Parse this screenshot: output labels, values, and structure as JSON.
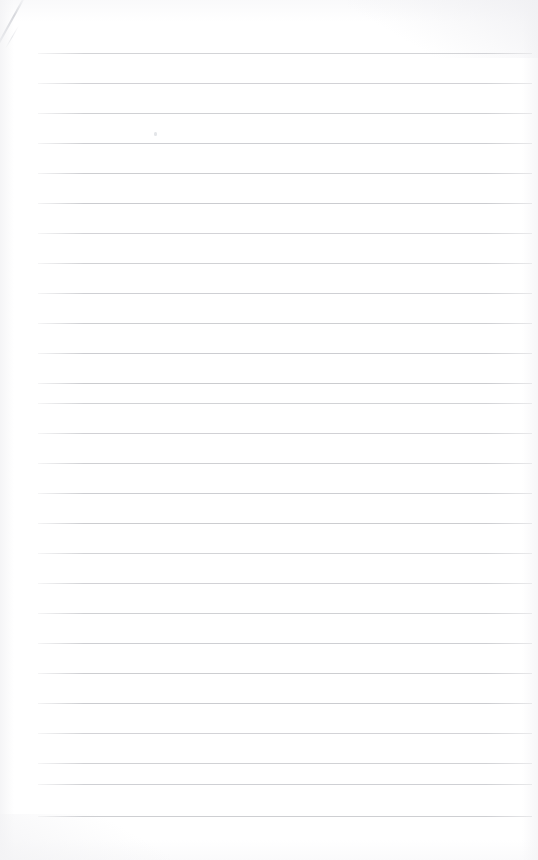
{
  "document": {
    "kind": "scanned-page",
    "title": "Blank Lined Notepad Page",
    "content_text": "",
    "page_width": 538,
    "page_height": 860,
    "background_color": "#ffffff"
  },
  "ruling": {
    "line_color": "#c9cace",
    "line_thickness_px": 1,
    "line_spacing_px": 30,
    "first_line_y": 53,
    "left_margin_x": 38,
    "right_margin_x": 532,
    "line_count": 26,
    "line_y_positions": [
      53,
      83,
      113,
      143,
      173,
      203,
      233,
      263,
      293,
      323,
      353,
      383,
      403,
      433,
      463,
      493,
      523,
      553,
      583,
      613,
      643,
      673,
      703,
      733,
      763,
      784,
      816
    ]
  },
  "artifacts": {
    "crease_label": "diagonal-crease-top-left",
    "speck_label": "toner-speck",
    "speck_x": 154,
    "speck_y": 132,
    "edge_shading_color": "#f3f3f5"
  }
}
